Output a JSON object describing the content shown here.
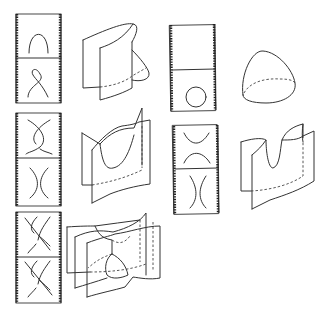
{
  "figure": {
    "panels": [
      {
        "id": "saddle-twist",
        "strip_frames": [
          "cap arc",
          "twisted loop crossing"
        ],
        "surface": "folded sheet with fold-back"
      },
      {
        "id": "circle-birth",
        "strip_frames": [
          "empty",
          "circle"
        ],
        "surface": "dome (disk cap)"
      },
      {
        "id": "crossing-to-arcs",
        "strip_frames": [
          "crossing arcs",
          "parallel vertical arcs"
        ],
        "surface": "two sheets with saddle intersection"
      },
      {
        "id": "saddle",
        "strip_frames": [
          "cup over cap",
          "parallel vertical arcs"
        ],
        "surface": "saddle sheet"
      },
      {
        "id": "braid",
        "strip_frames": [
          "braid of three strands",
          "braid of three strands"
        ],
        "surface": "three intersecting sheets with triple point"
      }
    ]
  },
  "colors": {
    "ink": "#333333",
    "background": "#ffffff"
  }
}
